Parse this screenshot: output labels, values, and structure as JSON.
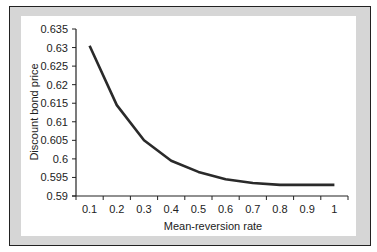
{
  "chart_data": {
    "type": "line",
    "title": "",
    "xlabel": "Mean-reversion rate",
    "ylabel": "Discount bond price",
    "categories": [
      "0.1",
      "0.2",
      "0.3",
      "0.4",
      "0.5",
      "0.6",
      "0.7",
      "0.8",
      "0.9",
      "1"
    ],
    "x": [
      0.1,
      0.2,
      0.3,
      0.4,
      0.5,
      0.6,
      0.7,
      0.8,
      0.9,
      1.0
    ],
    "series": [
      {
        "name": "Discount bond price",
        "values": [
          0.6305,
          0.6145,
          0.605,
          0.5995,
          0.5965,
          0.5945,
          0.5935,
          0.593,
          0.593,
          0.593
        ],
        "color": "#2a2a2a"
      }
    ],
    "ylim": [
      0.59,
      0.635
    ],
    "yticks": [
      "0.59",
      "0.595",
      "0.6",
      "0.605",
      "0.61",
      "0.615",
      "0.62",
      "0.625",
      "0.63",
      "0.635"
    ],
    "grid": false,
    "legend": "none"
  },
  "colors": {
    "frame_fill": "#d6d6d6",
    "frame_border": "#222222",
    "plot_bg": "#ffffff",
    "line": "#2a2a2a"
  }
}
